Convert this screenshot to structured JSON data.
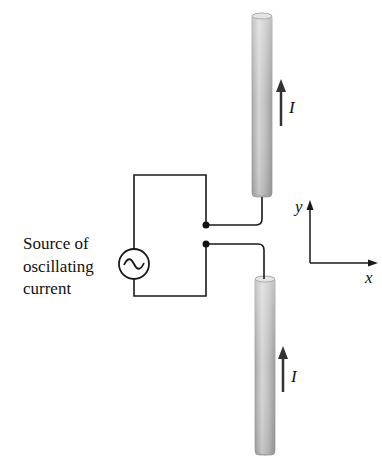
{
  "diagram": {
    "type": "dipole-antenna",
    "source": {
      "label_lines": [
        "Source of",
        "oscillating",
        "current"
      ],
      "symbol": "ac-source-tilde"
    },
    "rods": [
      {
        "position": "upper",
        "current_label": "I",
        "current_direction": "up"
      },
      {
        "position": "lower",
        "current_label": "I",
        "current_direction": "up"
      }
    ],
    "axes": {
      "x_label": "x",
      "y_label": "y"
    },
    "colors": {
      "wire": "#1a1a1a",
      "rod_light": "#d9d9d9",
      "rod_mid": "#b3b3b3",
      "rod_dark": "#9a9a9a",
      "arrow": "#333333"
    }
  }
}
